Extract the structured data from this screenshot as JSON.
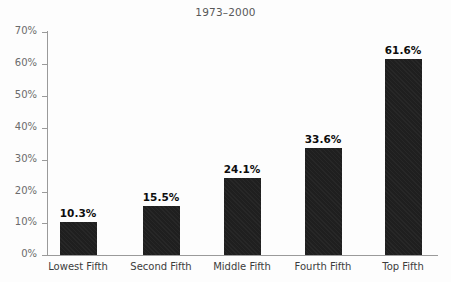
{
  "chart_data": {
    "type": "bar",
    "title": "1973–2000",
    "subtitle": "",
    "xlabel": "",
    "ylabel": "",
    "categories": [
      "Lowest Fifth",
      "Second Fifth",
      "Middle Fifth",
      "Fourth Fifth",
      "Top Fifth"
    ],
    "values": [
      10.3,
      15.5,
      24.1,
      33.6,
      61.6
    ],
    "value_labels": [
      "10.3%",
      "15.5%",
      "24.1%",
      "33.6%",
      "61.6%"
    ],
    "ylim": [
      0,
      70
    ],
    "y_ticks": [
      0,
      10,
      20,
      30,
      40,
      50,
      60,
      70
    ],
    "y_tick_labels": [
      "0%",
      "10%",
      "20%",
      "30%",
      "40%",
      "50%",
      "60%",
      "70%"
    ],
    "grid": false,
    "legend": false,
    "legend_position": "none",
    "bar_color": "#1f1f1f",
    "axis_color": "#9a9a9a",
    "title_color": "#585858",
    "tick_label_color": "#6b6b6b",
    "category_label_color": "#3c3c3c",
    "value_label_color": "#0d0d0d",
    "background_color": "#fdfdfd"
  }
}
